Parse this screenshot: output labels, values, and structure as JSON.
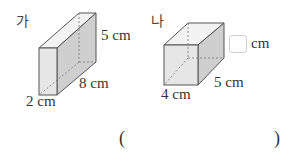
{
  "figures": [
    {
      "label": "가",
      "shape": "rectangular-prism",
      "dimensions": {
        "height": "5 cm",
        "length": "8 cm",
        "width": "2 cm"
      }
    },
    {
      "label": "나",
      "shape": "rectangular-prism",
      "dimensions": {
        "height_unit": "cm",
        "length": "5 cm",
        "width": "4 cm"
      }
    }
  ],
  "answer": {
    "open_paren": "(",
    "close_paren": ")",
    "value": ""
  },
  "colors": {
    "face_front": "#e6e6e6",
    "face_side": "#cfcfcf",
    "face_top": "#f2f2f2",
    "edge": "#555555",
    "hidden_edge": "#777777"
  }
}
